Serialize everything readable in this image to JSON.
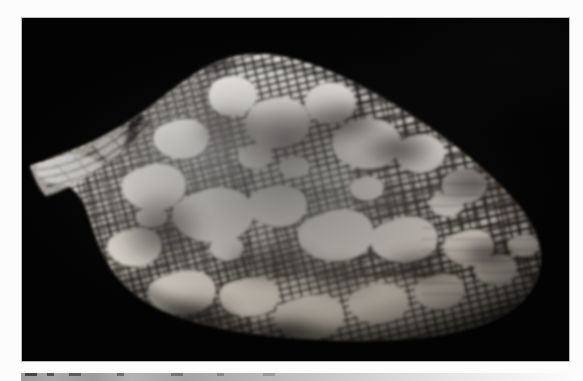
{
  "page": {
    "background_color": "#fcfcfc",
    "width": 583,
    "height": 381
  },
  "figure": {
    "name": "cone-shell-photograph",
    "panel": {
      "background_color": "#050505",
      "border_color": "#b9b9b9",
      "left": 21,
      "top": 17,
      "width": 549,
      "height": 345
    },
    "subject": {
      "common_name": "textile cone shell",
      "orientation": "side view, apex to the left, anterior end to the right",
      "shell_colors": {
        "ground": "#f7f4ee",
        "highlight": "#ffffff",
        "reticulation": "#2a2520",
        "dark_band": "#4a433c",
        "shadow": "#6d665e"
      },
      "pattern_description": "white tent-shaped blotches over a fine dark reticulated net with two broad cloudy spiral bands",
      "apex": {
        "x": 30,
        "y": 166
      },
      "anterior_end": {
        "x": 535,
        "y": 232
      },
      "shoulder": {
        "x": 180,
        "y": 57
      },
      "max_width_px": 505,
      "max_height_px": 280
    }
  },
  "next_figure": {
    "name": "cropped-figure-below",
    "description": "top sliver of the following figure, cut off by the page edge",
    "left": 21,
    "top": 373,
    "width": 549,
    "height": 8,
    "tick_positions": [
      4,
      26,
      48,
      96,
      150,
      196,
      242
    ]
  }
}
